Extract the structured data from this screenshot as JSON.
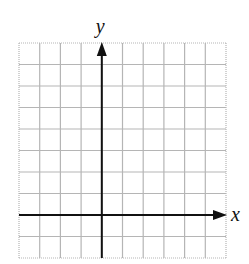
{
  "diagram": {
    "type": "coordinate-grid",
    "columns": 10,
    "rows": 10,
    "y_axis_column_index": 4,
    "x_axis_row_index": 8,
    "axes": {
      "x_label": "x",
      "y_label": "y"
    },
    "colors": {
      "grid": "#b5b5b5",
      "axis": "#111111",
      "background": "#ffffff"
    }
  },
  "chart_data": {
    "type": "grid",
    "title": "",
    "xlabel": "x",
    "ylabel": "y",
    "grid": true,
    "x_range_cells": [
      -4,
      6
    ],
    "y_range_cells": [
      -2,
      8
    ],
    "series": []
  }
}
